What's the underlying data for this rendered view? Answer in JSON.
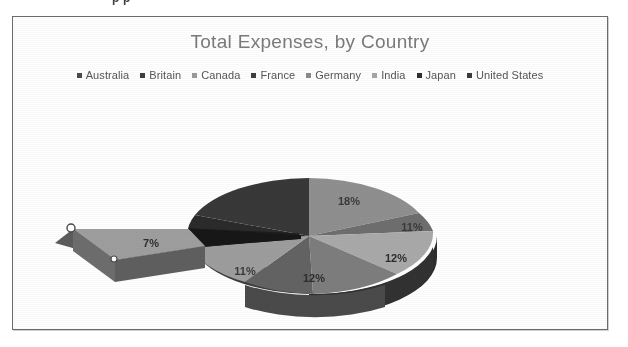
{
  "page": {
    "clipped_header_text": "p   p",
    "background_color": "#ffffff"
  },
  "chart_frame": {
    "border_color": "#6b6b6e",
    "background_color": "#fefefe"
  },
  "chart_data": {
    "type": "pie",
    "title": "Total Expenses, by Country",
    "xlabel": "",
    "ylabel": "",
    "legend_position": "top",
    "grid": false,
    "exploded_slice": "Japan",
    "categories": [
      "Australia",
      "Britain",
      "Canada",
      "France",
      "Germany",
      "India",
      "Japan",
      "United States"
    ],
    "values": [
      18,
      11,
      12,
      12,
      11,
      7,
      14,
      15
    ],
    "labels": [
      "18%",
      "11%",
      "12%",
      "12%",
      "11%",
      "7%",
      "",
      ""
    ],
    "visible_labels": [
      "18%",
      "11%",
      "12%",
      "12%",
      "11%",
      "7%"
    ],
    "colors": [
      "#8e8e8e",
      "#6f6f6f",
      "#a8a8a8",
      "#6a6a6a",
      "#9a9a9a",
      "#9d9d9d",
      "#3a3a3a",
      "#4a4a4a"
    ]
  },
  "legend": {
    "items": [
      {
        "label": "Australia",
        "color": "#4a4a4a"
      },
      {
        "label": "Britain",
        "color": "#3f3f3f"
      },
      {
        "label": "Canada",
        "color": "#9a9a9a"
      },
      {
        "label": "France",
        "color": "#3f3f3f"
      },
      {
        "label": "Germany",
        "color": "#8a8a8a"
      },
      {
        "label": "India",
        "color": "#a5a5a5"
      },
      {
        "label": "Japan",
        "color": "#2f2f2f"
      },
      {
        "label": "United States",
        "color": "#3a3a3a"
      }
    ]
  },
  "selection": {
    "handle_visible": true,
    "handle_count": 2
  }
}
